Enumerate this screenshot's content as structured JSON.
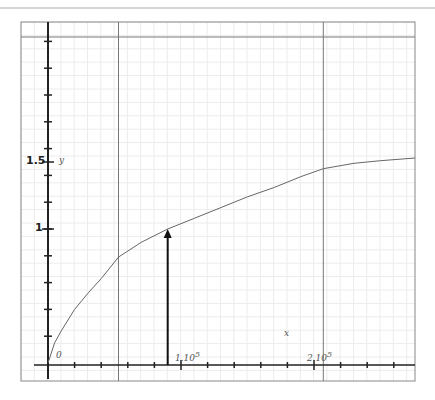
{
  "chart_data": {
    "type": "line",
    "title": "",
    "xlabel": "x",
    "ylabel": "y",
    "origin_label": "0",
    "x_tick_labels": [
      {
        "value": 100000,
        "label": "1.10",
        "exp": "5"
      },
      {
        "value": 200000,
        "label": "2.10",
        "exp": "5"
      }
    ],
    "y_tick_labels": [
      {
        "value": 1,
        "label": "1"
      },
      {
        "value": 1.5,
        "label": "1.5"
      }
    ],
    "x_minor_tick_step": 20000,
    "y_minor_tick_step": 0.2,
    "xlim": [
      -10000,
      276000
    ],
    "ylim": [
      -0.12,
      2.56
    ],
    "grid": true,
    "series": [
      {
        "name": "curve",
        "x": [
          0,
          5000,
          10000,
          20000,
          30000,
          40000,
          53000,
          70000,
          90000,
          110000,
          130000,
          150000,
          170000,
          190000,
          207000,
          230000,
          250000,
          276000
        ],
        "y": [
          0,
          0.15,
          0.24,
          0.4,
          0.52,
          0.63,
          0.79,
          0.9,
          1.0,
          1.08,
          1.16,
          1.24,
          1.31,
          1.39,
          1.45,
          1.49,
          1.51,
          1.53
        ]
      }
    ],
    "annotations": [
      {
        "type": "arrow",
        "x": 90000,
        "from_y": 0,
        "to_y": 1.0
      }
    ],
    "reference_lines": {
      "vertical_x": [
        53000,
        207000
      ],
      "horizontal_px_top": 37
    }
  }
}
